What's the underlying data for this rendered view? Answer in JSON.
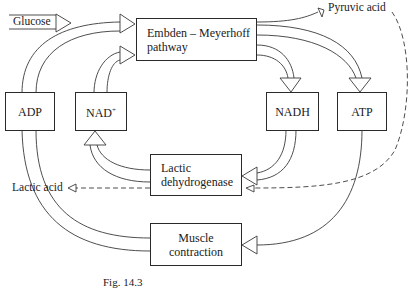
{
  "diagram": {
    "caption": "Fig. 14.3",
    "nodes": {
      "embden": {
        "line1": "Embden – Meyerhoff",
        "line2": "pathway"
      },
      "adp": {
        "label": "ADP"
      },
      "nad": {
        "label": "NAD",
        "sup": "+"
      },
      "nadh": {
        "label": "NADH"
      },
      "atp": {
        "label": "ATP"
      },
      "ldh": {
        "line1": "Lactic",
        "line2": "dehydrogenase"
      },
      "muscle": {
        "line1": "Muscle",
        "line2": "contraction"
      }
    },
    "labels": {
      "glucose": "Glucose",
      "pyruvic_acid": "Pyruvic acid",
      "lactic_acid": "Lactic acid"
    },
    "edges": [
      {
        "from": "Glucose",
        "to": "Embden – Meyerhoff pathway",
        "style": "double"
      },
      {
        "from": "ADP",
        "to": "Embden – Meyerhoff pathway",
        "style": "double"
      },
      {
        "from": "NAD+",
        "to": "Embden – Meyerhoff pathway",
        "style": "double"
      },
      {
        "from": "Embden – Meyerhoff pathway",
        "to": "Pyruvic acid",
        "style": "single"
      },
      {
        "from": "Embden – Meyerhoff pathway",
        "to": "NADH",
        "style": "double"
      },
      {
        "from": "Embden – Meyerhoff pathway",
        "to": "ATP",
        "style": "double"
      },
      {
        "from": "NADH",
        "to": "Lactic dehydrogenase",
        "style": "double"
      },
      {
        "from": "Pyruvic acid",
        "to": "Lactic dehydrogenase",
        "style": "dashed"
      },
      {
        "from": "Lactic dehydrogenase",
        "to": "NAD+",
        "style": "double"
      },
      {
        "from": "Lactic dehydrogenase",
        "to": "Lactic acid",
        "style": "dashed"
      },
      {
        "from": "ATP",
        "to": "Muscle contraction",
        "style": "single"
      },
      {
        "from": "Muscle contraction",
        "to": "ADP",
        "style": "double"
      }
    ]
  }
}
